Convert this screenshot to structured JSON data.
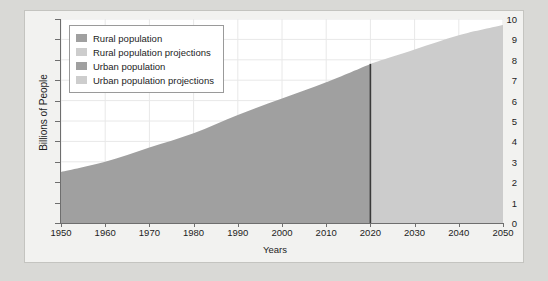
{
  "chart_data": {
    "type": "area",
    "title": "",
    "xlabel": "Years",
    "ylabel": "Billions of People",
    "xlim": [
      1950,
      2050
    ],
    "ylim": [
      0,
      10
    ],
    "xticks": [
      1950,
      1960,
      1970,
      1980,
      1990,
      2000,
      2010,
      2020,
      2030,
      2040,
      2050
    ],
    "yticks": [
      0,
      1,
      2,
      3,
      4,
      5,
      6,
      7,
      8,
      9,
      10
    ],
    "grid": true,
    "legend_position": "upper left",
    "projection_divider_year": 2020,
    "x": [
      1950,
      1960,
      1970,
      1980,
      1990,
      2000,
      2010,
      2020,
      2030,
      2040,
      2050
    ],
    "series": [
      {
        "name": "Total population (historical)",
        "color": "#a0a0a0",
        "x": [
          1950,
          1960,
          1970,
          1980,
          1990,
          2000,
          2010,
          2020
        ],
        "values": [
          2.5,
          3.0,
          3.7,
          4.4,
          5.3,
          6.1,
          6.9,
          7.8
        ]
      },
      {
        "name": "Total population (projections)",
        "color": "#cccccc",
        "x": [
          2020,
          2030,
          2040,
          2050
        ],
        "values": [
          7.8,
          8.5,
          9.2,
          9.7
        ]
      }
    ],
    "legend": [
      {
        "label": "Rural population",
        "color": "#a0a0a0"
      },
      {
        "label": "Rural population projections",
        "color": "#cdcdcd"
      },
      {
        "label": "Urban population",
        "color": "#a0a0a0"
      },
      {
        "label": "Urban population projections",
        "color": "#cdcdcd"
      }
    ],
    "colors": {
      "historical": "#a0a0a0",
      "projection": "#cccccc",
      "divider": "#3a3a3a",
      "grid": "#e8e8e8",
      "axis": "#6e6e6e",
      "panel": "#f2f2f0",
      "page": "#d9d9d6"
    }
  }
}
